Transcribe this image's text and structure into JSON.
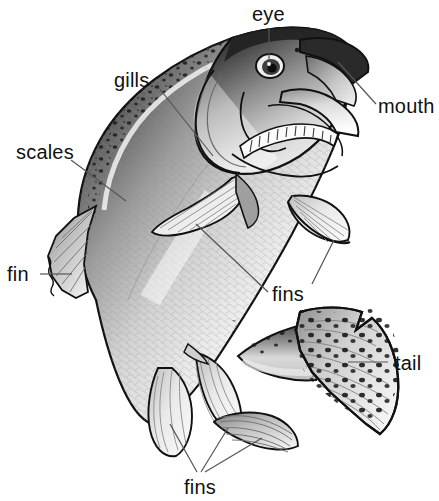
{
  "diagram": {
    "background_color": "#ffffff",
    "line_color": "#555555",
    "text_color": "#111111",
    "width": 439,
    "height": 501
  },
  "labels": {
    "eye": "eye",
    "mouth": "mouth",
    "gills": "gills",
    "scales": "scales",
    "fin": "fin",
    "fins_middle": "fins",
    "tail": "tail",
    "fins_bottom": "fins"
  }
}
